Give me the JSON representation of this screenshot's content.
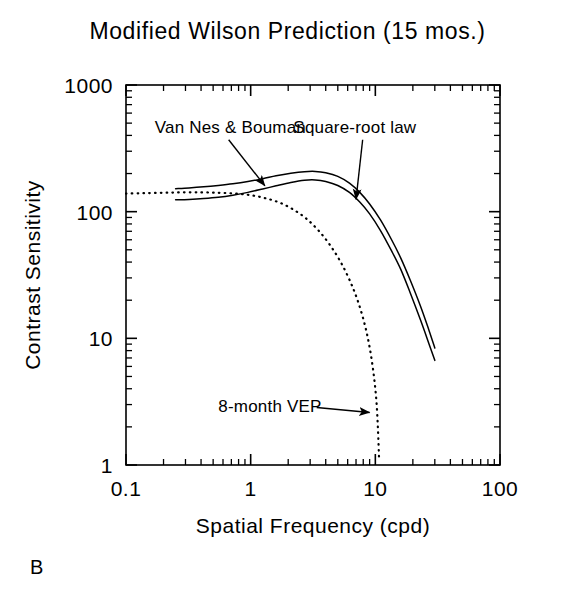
{
  "figure": {
    "title": "Modified Wilson Prediction (15 mos.)",
    "panel_label": "B"
  },
  "chart_data": {
    "type": "line",
    "title": "Modified Wilson Prediction (15 mos.)",
    "xlabel": "Spatial Frequency (cpd)",
    "ylabel": "Contrast Sensitivity",
    "xscale": "log",
    "yscale": "log",
    "xlim": [
      0.1,
      100
    ],
    "ylim": [
      1,
      1000
    ],
    "xticks": [
      0.1,
      1,
      10,
      100
    ],
    "xticklabels": [
      "0.1",
      "1",
      "10",
      "100"
    ],
    "yticks": [
      1,
      10,
      100,
      1000
    ],
    "yticklabels": [
      "1",
      "10",
      "100",
      "1000"
    ],
    "grid": false,
    "minor_ticks": true,
    "legend": "none",
    "annotations": [
      {
        "text": "Van Nes & Bouman",
        "target_series": "Van Nes & Bouman",
        "label_x": 0.17,
        "label_y": 420,
        "arrow_to_x": 1.3,
        "arrow_to_y": 160
      },
      {
        "text": "Square-root law",
        "target_series": "Square-root law",
        "label_x": 2.2,
        "label_y": 420,
        "arrow_to_x": 7.0,
        "arrow_to_y": 125
      },
      {
        "text": "8-month VEP",
        "target_series": "8-month VEP",
        "label_x": 0.55,
        "label_y": 2.6,
        "arrow_to_x": 9.0,
        "arrow_to_y": 2.6
      }
    ],
    "series": [
      {
        "name": "Van Nes & Bouman",
        "style": "solid",
        "color": "#000000",
        "points": [
          [
            0.25,
            152
          ],
          [
            0.32,
            154
          ],
          [
            0.42,
            157
          ],
          [
            0.55,
            161
          ],
          [
            0.72,
            166
          ],
          [
            0.95,
            173
          ],
          [
            1.25,
            182
          ],
          [
            1.6,
            192
          ],
          [
            2.1,
            201
          ],
          [
            2.7,
            207
          ],
          [
            3.3,
            208
          ],
          [
            4.0,
            203
          ],
          [
            5.0,
            190
          ],
          [
            6.2,
            168
          ],
          [
            7.5,
            142
          ],
          [
            9.0,
            115
          ],
          [
            11.0,
            86
          ],
          [
            13.5,
            60
          ],
          [
            16.0,
            43
          ],
          [
            19.0,
            29
          ],
          [
            23.0,
            18
          ],
          [
            27.0,
            11.5
          ],
          [
            30.0,
            8.4
          ]
        ]
      },
      {
        "name": "Square-root law",
        "style": "solid",
        "color": "#000000",
        "points": [
          [
            0.25,
            124
          ],
          [
            0.32,
            125
          ],
          [
            0.42,
            127
          ],
          [
            0.55,
            130
          ],
          [
            0.72,
            135
          ],
          [
            0.95,
            142
          ],
          [
            1.25,
            151
          ],
          [
            1.6,
            160
          ],
          [
            2.1,
            170
          ],
          [
            2.7,
            177
          ],
          [
            3.3,
            178
          ],
          [
            4.0,
            173
          ],
          [
            5.0,
            161
          ],
          [
            6.2,
            142
          ],
          [
            7.5,
            119
          ],
          [
            9.0,
            96
          ],
          [
            11.0,
            71
          ],
          [
            13.5,
            49
          ],
          [
            16.0,
            35
          ],
          [
            19.0,
            23
          ],
          [
            23.0,
            14
          ],
          [
            27.0,
            9.0
          ],
          [
            30.0,
            6.7
          ]
        ]
      },
      {
        "name": "8-month VEP",
        "style": "dotted",
        "color": "#000000",
        "points": [
          [
            0.1,
            139
          ],
          [
            0.14,
            140
          ],
          [
            0.2,
            141
          ],
          [
            0.28,
            142
          ],
          [
            0.4,
            142
          ],
          [
            0.55,
            141
          ],
          [
            0.75,
            139
          ],
          [
            1.0,
            135
          ],
          [
            1.3,
            128
          ],
          [
            1.7,
            118
          ],
          [
            2.2,
            104
          ],
          [
            2.8,
            88
          ],
          [
            3.5,
            71
          ],
          [
            4.3,
            55
          ],
          [
            5.2,
            41
          ],
          [
            6.2,
            29
          ],
          [
            7.2,
            20
          ],
          [
            8.2,
            13
          ],
          [
            9.0,
            8.5
          ],
          [
            9.7,
            5.2
          ],
          [
            10.2,
            3.2
          ],
          [
            10.5,
            1.9
          ],
          [
            10.7,
            1.15
          ]
        ]
      }
    ]
  }
}
